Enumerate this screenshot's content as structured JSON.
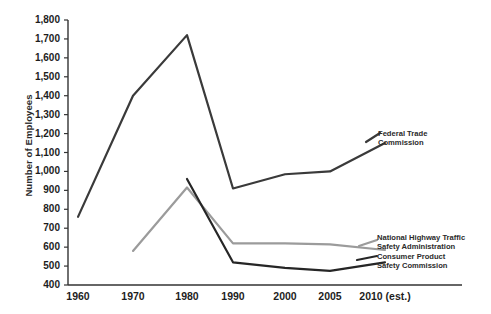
{
  "chart_data": {
    "type": "line",
    "title": "",
    "xlabel": "",
    "ylabel": "Number of Employees",
    "categories": [
      "1960",
      "1970",
      "1980",
      "1990",
      "2000",
      "2005",
      "2010 (est.)"
    ],
    "x_values": [
      1960,
      1970,
      1980,
      1990,
      2000,
      2005,
      2010
    ],
    "ylim": [
      400,
      1800
    ],
    "y_ticks": [
      "400",
      "500",
      "600",
      "700",
      "800",
      "900",
      "1,000",
      "1,100",
      "1,200",
      "1,300",
      "1,400",
      "1,500",
      "1,600",
      "1,700",
      "1,800"
    ],
    "y_tick_values": [
      400,
      500,
      600,
      700,
      800,
      900,
      1000,
      1100,
      1200,
      1300,
      1400,
      1500,
      1600,
      1700,
      1800
    ],
    "grid": false,
    "legend_position": "right-inline-labels",
    "series": [
      {
        "name": "Federal Trade Commission",
        "color": "#3a3a3a",
        "label_lines": [
          "Federal Trade",
          "Commission"
        ],
        "values": [
          760,
          1400,
          1720,
          910,
          985,
          1000,
          1150
        ]
      },
      {
        "name": "National Highway Traffic Safety Administration",
        "color": "#9b9b9b",
        "label_lines": [
          "National Highway Traffic",
          "Safety Administration"
        ],
        "values": [
          null,
          580,
          915,
          620,
          620,
          615,
          585
        ]
      },
      {
        "name": "Consumer Product Safety Commission",
        "color": "#262626",
        "label_lines": [
          "Consumer Product",
          "Safety Commission"
        ],
        "values": [
          null,
          null,
          960,
          520,
          490,
          475,
          520
        ]
      }
    ]
  },
  "axis": {
    "y_title": "Number of Employees"
  }
}
